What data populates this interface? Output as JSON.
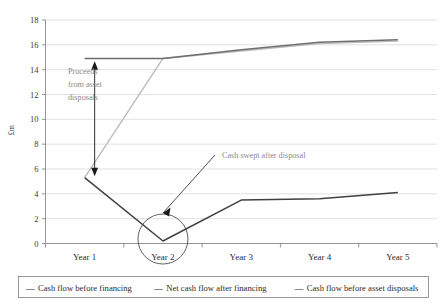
{
  "chart_data": {
    "type": "line",
    "title": "",
    "xlabel": "",
    "ylabel": "£m",
    "categories": [
      "Year 1",
      "Year 2",
      "Year 3",
      "Year 4",
      "Year 5"
    ],
    "ylim": [
      0,
      18
    ],
    "yticks": [
      0,
      2,
      4,
      6,
      8,
      10,
      12,
      14,
      16,
      18
    ],
    "ytick_labels": [
      "0",
      "2",
      "4",
      "6",
      "8",
      "10",
      "12",
      "14",
      "16",
      "18"
    ],
    "grid": true,
    "legend_position": "bottom",
    "series": [
      {
        "name": "Cash flow before financing",
        "color": "#6e6e6e",
        "values": [
          14.9,
          14.9,
          15.6,
          16.2,
          16.4
        ]
      },
      {
        "name": "Net cash flow after financing",
        "color": "#404040",
        "values": [
          5.3,
          0.2,
          3.5,
          3.6,
          4.1
        ]
      },
      {
        "name": "Cash flow before asset disposals",
        "color": "#bcbcbc",
        "values": [
          5.3,
          14.9,
          15.5,
          16.1,
          16.3
        ]
      }
    ],
    "annotations": [
      {
        "name": "proceeds-from-asset-disposals",
        "lines": [
          "Proceeds",
          "from asset",
          "disposals"
        ],
        "marker": "double-headed-arrow",
        "from_value": 5.9,
        "to_value": 14.2,
        "at_category": "Year 1"
      },
      {
        "name": "cash-swept-after-disposal",
        "lines": [
          "Cash swept after disposal"
        ],
        "marker": "arrow-to-circle",
        "points_at_category": "Year 2",
        "points_at_value": 0.2
      }
    ],
    "highlight_circle": {
      "name": "year-2-highlight-circle",
      "at_category": "Year 2",
      "at_value": 0.2
    }
  },
  "legend": {
    "dash_glyph": "—",
    "entries": [
      "Cash flow before financing",
      "Net cash flow after financing",
      "Cash flow before asset disposals"
    ]
  }
}
